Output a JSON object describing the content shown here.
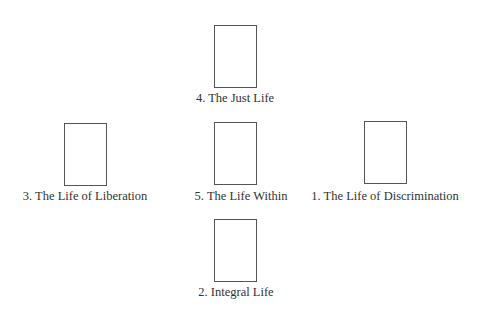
{
  "diagram": {
    "type": "cross-layout card spread",
    "colors": {
      "background": "#ffffff",
      "card_border": "#555555",
      "text": "#333333"
    },
    "positions": [
      {
        "id": "top",
        "number": 4,
        "label": "4. The Just Life",
        "card": {
          "left": 214,
          "top": 25,
          "width": 43,
          "height": 63
        },
        "label_center_x": 235,
        "label_top": 91
      },
      {
        "id": "left",
        "number": 3,
        "label": "3. The Life of Liberation",
        "card": {
          "left": 64,
          "top": 123,
          "width": 43,
          "height": 63
        },
        "label_center_x": 85,
        "label_top": 188
      },
      {
        "id": "center",
        "number": 5,
        "label": "5. The Life Within",
        "card": {
          "left": 214,
          "top": 122,
          "width": 43,
          "height": 63
        },
        "label_center_x": 241,
        "label_top": 188
      },
      {
        "id": "right",
        "number": 1,
        "label": "1. The Life of Discrimination",
        "card": {
          "left": 364,
          "top": 121,
          "width": 43,
          "height": 63
        },
        "label_center_x": 385,
        "label_top": 188
      },
      {
        "id": "bottom",
        "number": 2,
        "label": "2. Integral Life",
        "card": {
          "left": 214,
          "top": 219,
          "width": 43,
          "height": 63
        },
        "label_center_x": 236,
        "label_top": 285
      }
    ]
  }
}
